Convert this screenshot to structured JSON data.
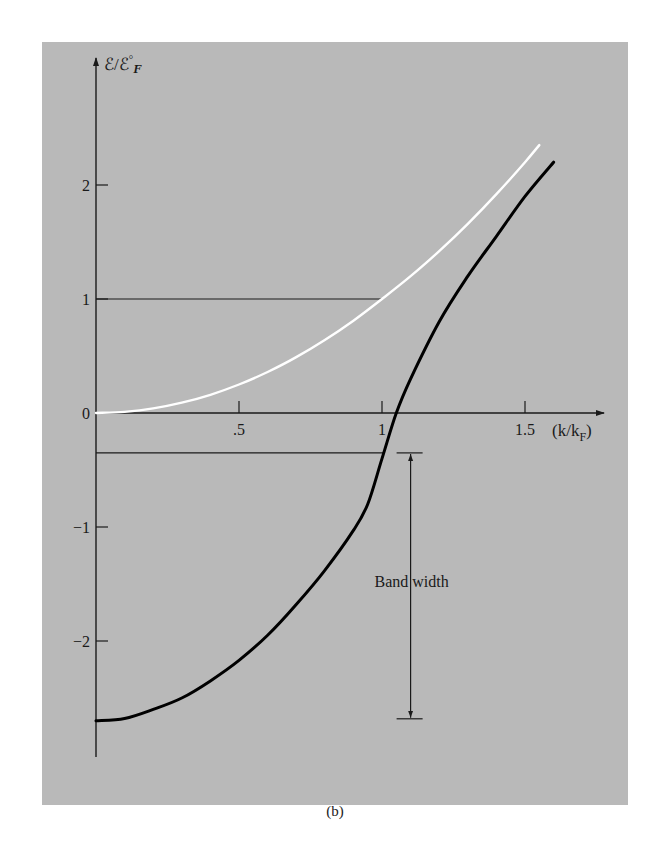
{
  "figure": {
    "caption": "(b)",
    "panel_color": "#b9b9b9"
  },
  "chart_data": {
    "type": "line",
    "title": "",
    "xlabel": "(k/k_F)",
    "ylabel": "ℰ/ℰ°_F",
    "xlim": [
      0,
      1.75
    ],
    "ylim": [
      -3.0,
      2.7
    ],
    "grid": false,
    "legend": "none",
    "x_ticks": [
      {
        "value": 0.5,
        "label": ".5"
      },
      {
        "value": 1.0,
        "label": "1"
      },
      {
        "value": 1.5,
        "label": "1.5"
      }
    ],
    "y_ticks": [
      {
        "value": 2,
        "label": "2"
      },
      {
        "value": 1,
        "label": "1"
      },
      {
        "value": 0,
        "label": "0"
      },
      {
        "value": -1,
        "label": "-1"
      },
      {
        "value": -2,
        "label": "-2"
      }
    ],
    "series": [
      {
        "name": "free-electron band",
        "color": "#ffffff",
        "x": [
          0,
          0.1,
          0.2,
          0.3,
          0.4,
          0.5,
          0.6,
          0.7,
          0.8,
          0.9,
          1.0,
          1.1,
          1.2,
          1.3,
          1.4,
          1.5,
          1.55
        ],
        "y": [
          0,
          0.01,
          0.04,
          0.09,
          0.16,
          0.25,
          0.36,
          0.49,
          0.64,
          0.81,
          1.0,
          1.2,
          1.42,
          1.66,
          1.92,
          2.2,
          2.35
        ]
      },
      {
        "name": "Hartree-Fock band",
        "color": "#000000",
        "x": [
          0,
          0.1,
          0.2,
          0.3,
          0.4,
          0.5,
          0.6,
          0.7,
          0.8,
          0.9,
          0.95,
          1.0,
          1.05,
          1.1,
          1.2,
          1.3,
          1.4,
          1.5,
          1.6
        ],
        "y": [
          -2.7,
          -2.68,
          -2.6,
          -2.5,
          -2.35,
          -2.17,
          -1.95,
          -1.68,
          -1.38,
          -1.03,
          -0.8,
          -0.4,
          0.0,
          0.3,
          0.8,
          1.2,
          1.55,
          1.9,
          2.2
        ]
      }
    ],
    "annotations": [
      {
        "type": "hline",
        "y": 1,
        "x_from": 0,
        "x_to": 1.0
      },
      {
        "type": "hline",
        "y": -0.35,
        "x_from": 0,
        "x_to": 1.01
      },
      {
        "type": "double-arrow",
        "label": "Band width",
        "x": 1.1,
        "y_from": -0.35,
        "y_to": -2.7
      }
    ]
  }
}
